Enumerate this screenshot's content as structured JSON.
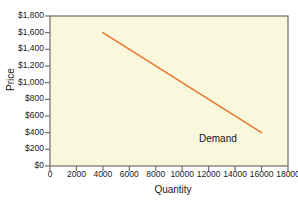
{
  "chart_data": {
    "type": "line",
    "title": "",
    "xlabel": "Quantity",
    "ylabel": "Price",
    "xlim": [
      0,
      18000
    ],
    "ylim": [
      0,
      1800
    ],
    "grid": false,
    "legend_position": "inline-right",
    "x_ticks": [
      "0",
      "2000",
      "4000",
      "6000",
      "8000",
      "10000",
      "12000",
      "14000",
      "16000",
      "18000"
    ],
    "x_tick_values": [
      0,
      2000,
      4000,
      6000,
      8000,
      10000,
      12000,
      14000,
      16000,
      18000
    ],
    "y_ticks": [
      "$0",
      "$200",
      "$400",
      "$600",
      "$800",
      "$1,000",
      "$1,200",
      "$1,400",
      "$1,600",
      "$1,800"
    ],
    "y_tick_values": [
      0,
      200,
      400,
      600,
      800,
      1000,
      1200,
      1400,
      1600,
      1800
    ],
    "series": [
      {
        "name": "Demand",
        "color": "#E8772E",
        "x": [
          4000,
          16000
        ],
        "values": [
          1600,
          400
        ]
      }
    ],
    "annotations": [
      {
        "text": "Demand",
        "x": 15200,
        "y": 330
      }
    ]
  },
  "style": {
    "plot_background": "#FAF8DC",
    "axis_color": "#6E6E66",
    "border_color": "#6E6E66",
    "text_color": "#1A1A1A",
    "page_background": "#FFFFFF",
    "series_color": "#E8772E"
  }
}
